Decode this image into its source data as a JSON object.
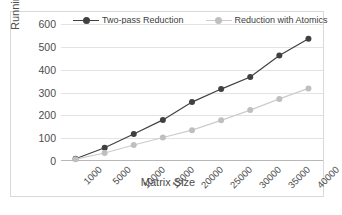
{
  "chart_data": {
    "type": "line",
    "title": "",
    "xlabel": "Matrix Size",
    "ylabel": "Running Time(ms)",
    "categories": [
      "1000",
      "5000",
      "10000",
      "15000",
      "20000",
      "25000",
      "30000",
      "35000",
      "40000"
    ],
    "ylim": [
      0,
      600
    ],
    "yticks": [
      "600",
      "500",
      "400",
      "300",
      "200",
      "100",
      "0"
    ],
    "ytick_values": [
      600,
      500,
      400,
      300,
      200,
      100,
      0
    ],
    "grid": true,
    "legend_position": "top-center",
    "series": [
      {
        "name": "Two-pass Reduction",
        "color": "#404040",
        "marker": "circle",
        "values": [
          10,
          58,
          118,
          180,
          258,
          315,
          368,
          462,
          535
        ]
      },
      {
        "name": "Reduction with Atomics",
        "color": "#bfbfbf",
        "marker": "circle",
        "values": [
          8,
          35,
          70,
          103,
          135,
          178,
          223,
          272,
          318
        ]
      }
    ]
  },
  "colors": {
    "series_one": "#404040",
    "series_two": "#bfbfbf",
    "grid": "#e3e3e3",
    "axis": "#b8b8b8",
    "text": "#4d4d4d",
    "border": "#d9d9d9",
    "background": "#ffffff"
  }
}
